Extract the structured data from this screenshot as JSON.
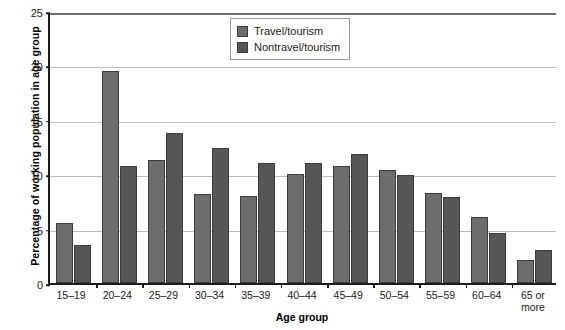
{
  "chart_data": {
    "type": "bar",
    "title": "",
    "xlabel": "Age group",
    "ylabel": "Percentage of working population in age group",
    "categories": [
      "15–19",
      "20–24",
      "25–29",
      "30–34",
      "35–39",
      "40–44",
      "45–49",
      "50–54",
      "55–59",
      "60–64",
      "65 or more"
    ],
    "series": [
      {
        "name": "Travel/tourism",
        "color": "#6d6d6d",
        "values": [
          5.5,
          19.5,
          11.3,
          8.2,
          8.0,
          10.0,
          10.8,
          10.4,
          8.3,
          6.1,
          2.1
        ]
      },
      {
        "name": "Nontravel/tourism",
        "color": "#565656",
        "values": [
          3.5,
          10.8,
          13.8,
          12.4,
          11.0,
          11.0,
          11.9,
          9.9,
          7.9,
          4.6,
          3.0
        ]
      }
    ],
    "ylim": [
      0,
      25
    ],
    "yticks": [
      0,
      5,
      10,
      15,
      20,
      25
    ],
    "ytick_labels": [
      "0",
      "5",
      "10",
      "15",
      "20",
      "25"
    ],
    "grid": true,
    "legend_position": "top-center"
  },
  "legend": {
    "items": [
      {
        "label": "Travel/tourism",
        "swatch": "s0"
      },
      {
        "label": "Nontravel/tourism",
        "swatch": "s1"
      }
    ]
  }
}
